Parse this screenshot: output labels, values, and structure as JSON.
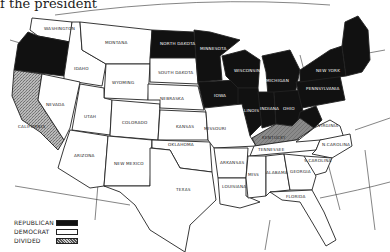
{
  "caption": "f the president",
  "map": {
    "title": "United States election map by party",
    "colors": {
      "republican": "#111111",
      "democrat": "#ffffff",
      "divided": "#9a9a9a",
      "outline": "#222222"
    },
    "states": {
      "washington": {
        "label": "WASHINGTON",
        "party": "democrat"
      },
      "oregon": {
        "label": "",
        "party": "republican"
      },
      "california": {
        "label": "CALIFORNIA",
        "party": "divided"
      },
      "idaho": {
        "label": "IDAHO",
        "party": "democrat"
      },
      "nevada": {
        "label": "NEVADA",
        "party": "democrat"
      },
      "montana": {
        "label": "MONTANA",
        "party": "democrat"
      },
      "wyoming": {
        "label": "WYOMING",
        "party": "democrat"
      },
      "utah": {
        "label": "UTAH",
        "party": "democrat"
      },
      "colorado": {
        "label": "COLORADO",
        "party": "democrat"
      },
      "arizona": {
        "label": "ARIZONA",
        "party": "democrat"
      },
      "new_mexico": {
        "label": "NEW MEXICO",
        "party": "democrat"
      },
      "north_dakota": {
        "label": "NORTH DAKOTA",
        "party": "republican"
      },
      "south_dakota": {
        "label": "SOUTH DAKOTA",
        "party": "democrat"
      },
      "nebraska": {
        "label": "NEBRASKA",
        "party": "democrat"
      },
      "kansas": {
        "label": "KANSAS",
        "party": "democrat"
      },
      "oklahoma": {
        "label": "OKLAHOMA",
        "party": "democrat"
      },
      "texas": {
        "label": "TEXAS",
        "party": "democrat"
      },
      "minnesota": {
        "label": "MINNESOTA",
        "party": "republican"
      },
      "iowa": {
        "label": "IOWA",
        "party": "republican"
      },
      "missouri": {
        "label": "MISSOURI",
        "party": "democrat"
      },
      "arkansas": {
        "label": "ARKANSAS",
        "party": "democrat"
      },
      "louisiana": {
        "label": "LOUISIANA",
        "party": "democrat"
      },
      "wisconsin": {
        "label": "WISCONSIN",
        "party": "republican"
      },
      "illinois": {
        "label": "ILLINOIS",
        "party": "republican"
      },
      "michigan": {
        "label": "MICHIGAN",
        "party": "republican"
      },
      "indiana": {
        "label": "INDIANA",
        "party": "republican"
      },
      "ohio": {
        "label": "OHIO",
        "party": "republican"
      },
      "kentucky": {
        "label": "KENTUCKY",
        "party": "divided"
      },
      "tennessee": {
        "label": "TENNESSEE",
        "party": "democrat"
      },
      "mississippi": {
        "label": "MISS",
        "party": "democrat"
      },
      "alabama": {
        "label": "ALABAMA",
        "party": "democrat"
      },
      "georgia": {
        "label": "GEORGIA",
        "party": "democrat"
      },
      "florida": {
        "label": "FLORIDA",
        "party": "democrat"
      },
      "s_carolina": {
        "label": "S.CAROLINA",
        "party": "democrat"
      },
      "n_carolina": {
        "label": "N.CAROLINA",
        "party": "democrat"
      },
      "virginia": {
        "label": "VIRGINIA",
        "party": "democrat"
      },
      "west_virginia": {
        "label": "W.VA",
        "party": "republican"
      },
      "pennsylvania": {
        "label": "PENNSYLVANIA",
        "party": "republican"
      },
      "new_york": {
        "label": "NEW YORK",
        "party": "republican"
      },
      "new_england": {
        "label": "ME",
        "party": "republican"
      }
    }
  },
  "legend": {
    "items": [
      {
        "label": "REPUBLICAN",
        "key": "republican"
      },
      {
        "label": "DEMOCRAT",
        "key": "democrat"
      },
      {
        "label": "DIVIDED",
        "key": "divided"
      }
    ]
  }
}
